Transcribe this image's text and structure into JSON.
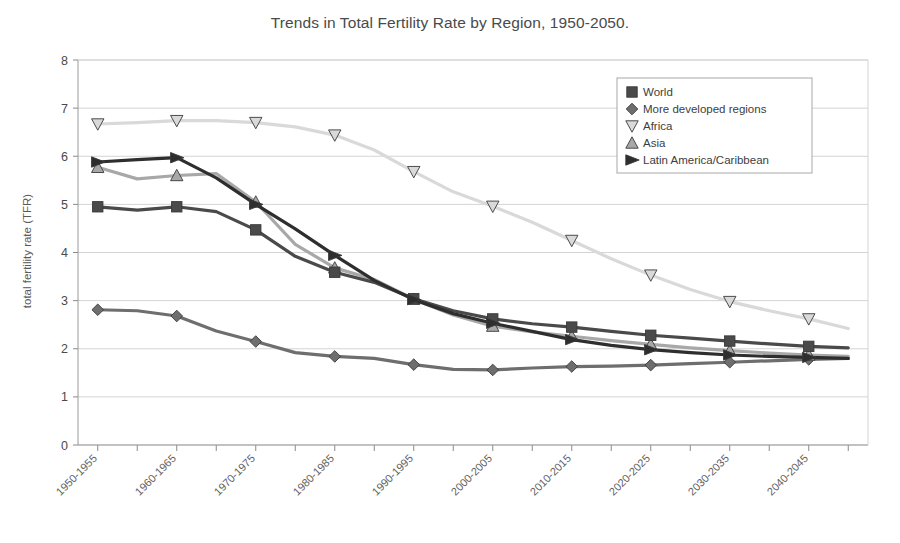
{
  "chart_data": {
    "type": "line",
    "title": "Trends in Total Fertility Rate by Region, 1950-2050.",
    "xlabel": "",
    "ylabel": "total fertility rate (TFR)",
    "ylim": [
      0,
      8
    ],
    "ytick_labels": [
      "0",
      "1",
      "2",
      "3",
      "4",
      "5",
      "6",
      "7",
      "8"
    ],
    "ytick_values": [
      0,
      1,
      2,
      3,
      4,
      5,
      6,
      7,
      8
    ],
    "grid": true,
    "legend_position": "top-right",
    "x": [
      "1950-1955",
      "1955-1960",
      "1960-1965",
      "1965-1970",
      "1970-1975",
      "1975-1980",
      "1980-1985",
      "1985-1990",
      "1990-1995",
      "1995-2000",
      "2000-2005",
      "2005-2010",
      "2010-2015",
      "2015-2020",
      "2020-2025",
      "2025-2030",
      "2030-2035",
      "2035-2040",
      "2040-2045",
      "2045-2050"
    ],
    "xtick_labels": [
      "1950-1955",
      "1960-1965",
      "1970-1975",
      "1980-1985",
      "1990-1995",
      "2000-2005",
      "2010-2015",
      "2020-2025",
      "2030-2035",
      "2040-2045"
    ],
    "series": [
      {
        "name": "World",
        "marker": "square",
        "color": "#4a4a4a",
        "values": [
          4.95,
          4.88,
          4.95,
          4.85,
          4.47,
          3.92,
          3.59,
          3.38,
          3.04,
          2.79,
          2.62,
          2.52,
          2.45,
          2.36,
          2.28,
          2.22,
          2.16,
          2.1,
          2.05,
          2.02
        ]
      },
      {
        "name": "More developed regions",
        "marker": "diamond",
        "color": "#6e6e6e",
        "values": [
          2.81,
          2.79,
          2.68,
          2.37,
          2.15,
          1.92,
          1.84,
          1.8,
          1.67,
          1.57,
          1.56,
          1.6,
          1.63,
          1.64,
          1.66,
          1.69,
          1.72,
          1.75,
          1.78,
          1.8
        ]
      },
      {
        "name": "Africa",
        "marker": "triangle-down",
        "color": "#d9d9d9",
        "values": [
          6.67,
          6.7,
          6.74,
          6.74,
          6.7,
          6.61,
          6.44,
          6.13,
          5.68,
          5.26,
          4.96,
          4.63,
          4.25,
          3.87,
          3.53,
          3.23,
          2.98,
          2.79,
          2.62,
          2.42
        ]
      },
      {
        "name": "Asia",
        "marker": "triangle-up",
        "color": "#a8a8a8",
        "values": [
          5.77,
          5.53,
          5.6,
          5.64,
          5.05,
          4.17,
          3.68,
          3.44,
          3.03,
          2.7,
          2.47,
          2.35,
          2.26,
          2.17,
          2.09,
          2.02,
          1.96,
          1.91,
          1.87,
          1.84
        ]
      },
      {
        "name": "Latin America/Caribbean",
        "marker": "triangle-right",
        "color": "#2e2e2e",
        "values": [
          5.88,
          5.93,
          5.97,
          5.55,
          5.0,
          4.49,
          3.94,
          3.42,
          3.02,
          2.73,
          2.53,
          2.36,
          2.19,
          2.07,
          1.98,
          1.92,
          1.87,
          1.84,
          1.82,
          1.8
        ]
      }
    ]
  },
  "legend": {
    "items": [
      {
        "label": "World"
      },
      {
        "label": "More developed regions"
      },
      {
        "label": "Africa"
      },
      {
        "label": "Asia"
      },
      {
        "label": "Latin America/Caribbean"
      }
    ]
  }
}
